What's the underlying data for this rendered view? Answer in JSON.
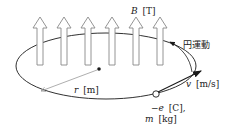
{
  "diagram": {
    "magnetic_field": {
      "symbol": "B",
      "unit": "[T]",
      "arrow_count": 6,
      "direction": "up",
      "arrow_x": [
        40,
        64,
        88,
        112,
        136,
        160
      ]
    },
    "motion_label": "円運動",
    "radius": {
      "symbol": "r",
      "unit": "[m]"
    },
    "velocity": {
      "symbol": "v",
      "unit": "[m/s]"
    },
    "charge": {
      "symbol": "−e",
      "unit": "[C],"
    },
    "mass": {
      "symbol": "m",
      "unit": "[kg]"
    },
    "colors": {
      "line": "#1a1a1a",
      "arrow_outline": "#888888",
      "radius_line": "#999999"
    }
  }
}
